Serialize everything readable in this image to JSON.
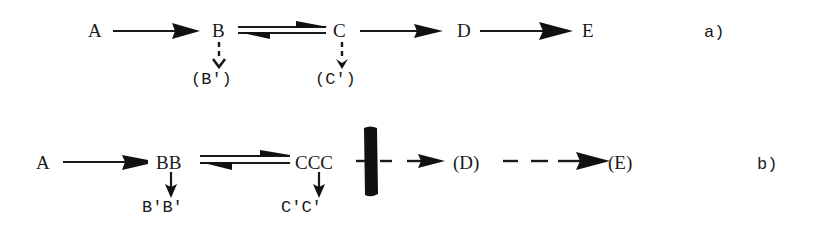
{
  "diagram": {
    "type": "reaction-scheme",
    "ink_color": "#1a1a1a",
    "background": "#ffffff",
    "scheme_a": {
      "label": "a)",
      "nodes": {
        "A": "A",
        "B": "B",
        "C": "C",
        "D": "D",
        "E": "E",
        "B_side": "(B')",
        "C_side": "(C')"
      },
      "edges": [
        {
          "from": "A",
          "to": "B",
          "style": "solid",
          "kind": "forward"
        },
        {
          "from": "B",
          "to": "C",
          "style": "solid",
          "kind": "equilibrium"
        },
        {
          "from": "C",
          "to": "D",
          "style": "solid",
          "kind": "forward"
        },
        {
          "from": "D",
          "to": "E",
          "style": "solid",
          "kind": "forward"
        },
        {
          "from": "B",
          "to": "(B')",
          "style": "dashed",
          "kind": "side"
        },
        {
          "from": "C",
          "to": "(C')",
          "style": "dashed",
          "kind": "side"
        }
      ]
    },
    "scheme_b": {
      "label": "b)",
      "nodes": {
        "A": "A",
        "BB": "BB",
        "CCC": "CCC",
        "D": "(D)",
        "E": "(E)",
        "B_side": "B'B'",
        "C_side": "C'C'"
      },
      "edges": [
        {
          "from": "A",
          "to": "BB",
          "style": "solid",
          "kind": "forward"
        },
        {
          "from": "BB",
          "to": "CCC",
          "style": "solid",
          "kind": "equilibrium"
        },
        {
          "from": "CCC",
          "to": "(D)",
          "style": "dashed",
          "kind": "forward",
          "blocked": true
        },
        {
          "from": "(D)",
          "to": "(E)",
          "style": "dashed",
          "kind": "forward"
        },
        {
          "from": "BB",
          "to": "B'B'",
          "style": "solid",
          "kind": "side"
        },
        {
          "from": "CCC",
          "to": "C'C'",
          "style": "solid",
          "kind": "side"
        }
      ],
      "block_marker": "thick-vertical-bar"
    }
  }
}
